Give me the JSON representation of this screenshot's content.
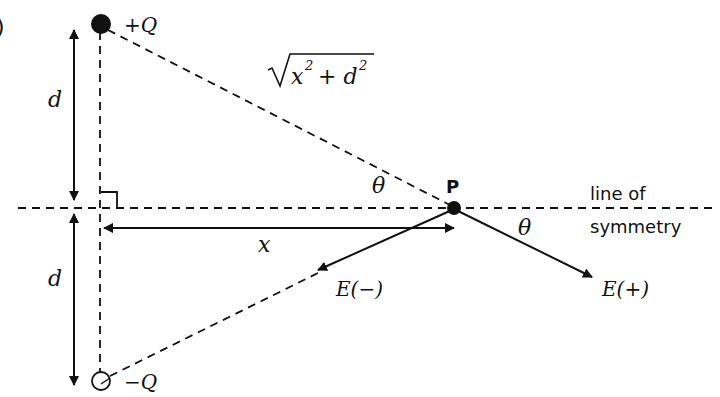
{
  "diagram": {
    "charges": {
      "positive": {
        "label": "+Q",
        "style": "filled"
      },
      "negative": {
        "label": "−Q",
        "style": "hollow"
      }
    },
    "point": {
      "label": "P"
    },
    "distances": {
      "upper_d": "d",
      "lower_d": "d",
      "x": "x",
      "hypotenuse_base": "x",
      "hypotenuse_plus": "+ d",
      "exp": "2"
    },
    "angles": {
      "upper": "θ",
      "lower": "θ"
    },
    "fields": {
      "negative": "E(−)",
      "positive": "E(+)"
    },
    "symmetry_line": {
      "line1": "line of",
      "line2": "symmetry"
    },
    "left_edge_partial": ")"
  }
}
